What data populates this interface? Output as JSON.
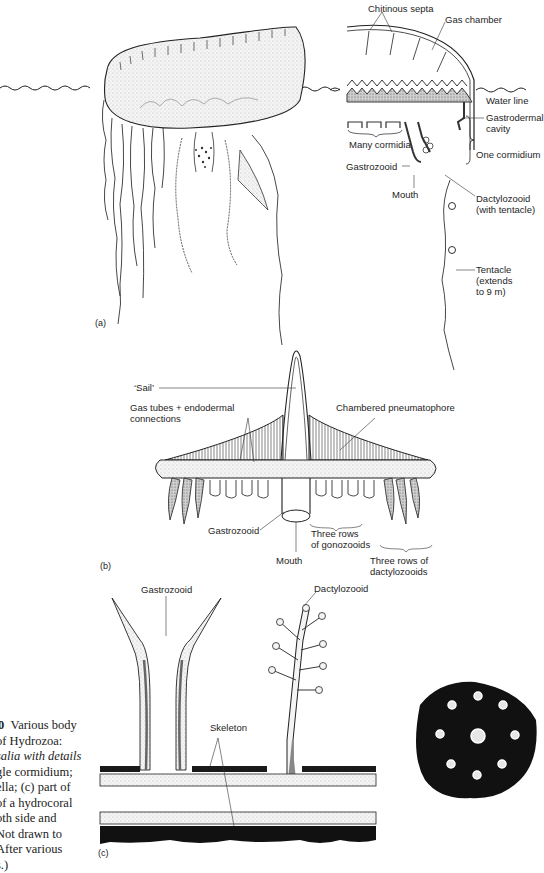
{
  "figure": {
    "panels": {
      "a": {
        "tag": "(a)",
        "labels": {
          "chitinous_septa": "Chitinous septa",
          "gas_chamber": "Gas chamber",
          "water_line": "Water line",
          "gastrodermal_cavity_1": "Gastrodermal",
          "gastrodermal_cavity_2": "cavity",
          "many_cormidia": "Many cormidia",
          "one_cormidium": "One cormidium",
          "gastrozooid": "Gastrozooid",
          "mouth": "Mouth",
          "dactylozooid_1": "Dactylozooid",
          "dactylozooid_2": "(with tentacle)",
          "tentacle_1": "Tentacle",
          "tentacle_2": "(extends",
          "tentacle_3": "to 9 m)"
        }
      },
      "b": {
        "tag": "(b)",
        "labels": {
          "sail": "‘Sail’",
          "gas_tubes_1": "Gas tubes + endodermal",
          "gas_tubes_2": "connections",
          "chambered_pneumatophore": "Chambered pneumatophore",
          "gastrozooid": "Gastrozooid",
          "mouth": "Mouth",
          "gonozooids_1": "Three rows",
          "gonozooids_2": "of gonozooids",
          "dactylozooids_1": "Three rows of",
          "dactylozooids_2": "dactylozooids"
        }
      },
      "c": {
        "tag": "(c)",
        "labels": {
          "gastrozooid": "Gastrozooid",
          "dactylozooid": "Dactylozooid",
          "skeleton": "Skeleton"
        }
      }
    },
    "caption": {
      "number": "0",
      "lines": [
        "Various body",
        "of Hydrozoa:",
        "salia with details",
        "gle cormidium;",
        "ella; (c) part of",
        "of a hydrocoral",
        "oth side and",
        "Not drawn to",
        "After various",
        "s.)"
      ]
    }
  }
}
